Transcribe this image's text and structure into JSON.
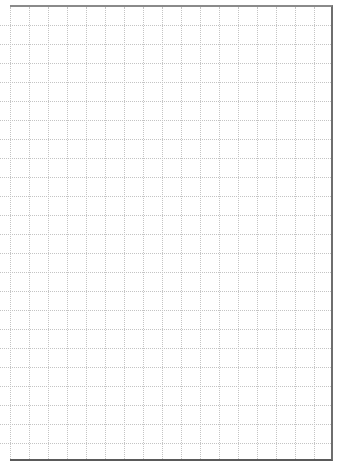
{
  "page": {
    "type": "grid-paper",
    "columns": 17,
    "rows": 24,
    "cell_size_px": 19,
    "grid_color": "#c4c4c4",
    "border_colors": {
      "top": "#8a8a8a",
      "right": "#6e6e6e",
      "bottom": "#5a5a5a"
    }
  }
}
